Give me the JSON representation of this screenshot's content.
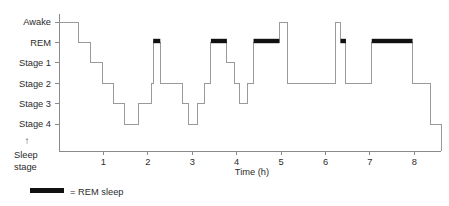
{
  "chart_data": {
    "type": "line",
    "title": "",
    "xlabel": "Time (h)",
    "ylabel": "Sleep stage",
    "ylabel_arrow": "↑",
    "grid": false,
    "xlim": [
      0,
      8.6
    ],
    "xticks": [
      1,
      2,
      3,
      4,
      5,
      6,
      7,
      8
    ],
    "xtick_labels": [
      "1",
      "2",
      "3",
      "4",
      "5",
      "6",
      "7",
      "8"
    ],
    "ytick_labels": [
      "Awake",
      "REM",
      "Stage 1",
      "Stage 2",
      "Stage 3",
      "Stage 4"
    ],
    "ylevels": [
      0,
      1,
      2,
      3,
      4,
      5
    ],
    "series": [
      {
        "name": "Sleep stage",
        "description": "Stepped hypnogram trace of sleep stage over the night",
        "steps": [
          {
            "t": 0.0,
            "stage": "Awake"
          },
          {
            "t": 0.45,
            "stage": "REM"
          },
          {
            "t": 0.72,
            "stage": "Stage 1"
          },
          {
            "t": 0.98,
            "stage": "Stage 2"
          },
          {
            "t": 1.22,
            "stage": "Stage 3"
          },
          {
            "t": 1.48,
            "stage": "Stage 4"
          },
          {
            "t": 1.8,
            "stage": "Stage 3"
          },
          {
            "t": 2.08,
            "stage": "Stage 2"
          },
          {
            "t": 2.12,
            "stage": "REM"
          },
          {
            "t": 2.28,
            "stage": "Stage 2"
          },
          {
            "t": 2.78,
            "stage": "Stage 3"
          },
          {
            "t": 2.92,
            "stage": "Stage 4"
          },
          {
            "t": 3.12,
            "stage": "Stage 3"
          },
          {
            "t": 3.28,
            "stage": "Stage 2"
          },
          {
            "t": 3.42,
            "stage": "REM"
          },
          {
            "t": 3.78,
            "stage": "Stage 1"
          },
          {
            "t": 3.96,
            "stage": "Stage 2"
          },
          {
            "t": 4.06,
            "stage": "Stage 3"
          },
          {
            "t": 4.24,
            "stage": "Stage 2"
          },
          {
            "t": 4.38,
            "stage": "REM"
          },
          {
            "t": 4.96,
            "stage": "Awake"
          },
          {
            "t": 5.14,
            "stage": "Stage 2"
          },
          {
            "t": 6.22,
            "stage": "Awake"
          },
          {
            "t": 6.34,
            "stage": "REM"
          },
          {
            "t": 6.46,
            "stage": "Stage 2"
          },
          {
            "t": 7.04,
            "stage": "REM"
          },
          {
            "t": 7.96,
            "stage": "Stage 2"
          },
          {
            "t": 8.36,
            "stage": "Stage 4"
          },
          {
            "t": 8.6,
            "stage": "Stage 4"
          }
        ],
        "rem_periods": [
          {
            "start": 2.12,
            "end": 2.28
          },
          {
            "start": 3.42,
            "end": 3.78
          },
          {
            "start": 4.38,
            "end": 4.96
          },
          {
            "start": 6.34,
            "end": 6.46
          },
          {
            "start": 7.04,
            "end": 7.96
          }
        ]
      }
    ]
  },
  "legend": {
    "marker": "rem-bar-swatch",
    "text": "= REM sleep",
    "color": "#111111"
  },
  "colors": {
    "trace": "#9a9a9a",
    "axis": "#8a8a8a",
    "rem": "#111111",
    "text": "#2b2b2b",
    "background": "#ffffff"
  }
}
